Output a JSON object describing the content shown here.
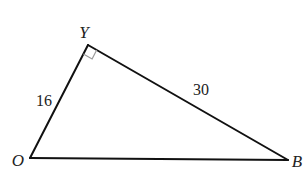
{
  "diagram": {
    "type": "right-triangle",
    "vertices": {
      "O": {
        "label": "O",
        "x": 30,
        "y": 158
      },
      "Y": {
        "label": "Y",
        "x": 88,
        "y": 45
      },
      "B": {
        "label": "B",
        "x": 288,
        "y": 160
      }
    },
    "right_angle_at": "Y",
    "sides": [
      {
        "from": "O",
        "to": "Y",
        "label": "16"
      },
      {
        "from": "Y",
        "to": "B",
        "label": "30"
      },
      {
        "from": "O",
        "to": "B",
        "label": ""
      }
    ],
    "colors": {
      "stroke": "#111111",
      "right_angle_marker": "#9a9a9a",
      "text": "#222222",
      "background": "#ffffff"
    }
  }
}
